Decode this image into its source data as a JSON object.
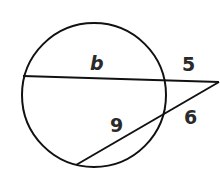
{
  "diagram": {
    "type": "geometry-two-secants",
    "labels": {
      "b": "b",
      "external_top": "5",
      "internal_bottom": "9",
      "external_bottom": "6"
    },
    "colors": {
      "stroke": "#111111",
      "text": "#2a2a2a",
      "background": "#ffffff"
    }
  }
}
